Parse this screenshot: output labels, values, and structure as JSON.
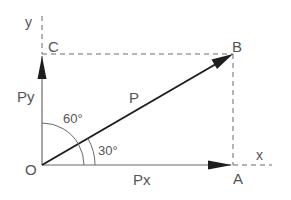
{
  "diagram": {
    "colors": {
      "line": "#6a6a6a",
      "vector": "#1e1e1e",
      "dashed": "#6a6a6a",
      "text": "#555555"
    },
    "points": {
      "origin": {
        "label": "O",
        "x": 42,
        "y": 165
      },
      "A": {
        "label": "A",
        "x": 233,
        "y": 165
      },
      "B": {
        "label": "B",
        "x": 233,
        "y": 54
      },
      "C": {
        "label": "C",
        "x": 42,
        "y": 54
      }
    },
    "axes": {
      "x_label": "x",
      "y_label": "y"
    },
    "vectors": {
      "P": {
        "label": "P",
        "angle_from_x_deg": 30
      },
      "Px": {
        "label": "Px"
      },
      "Py": {
        "label": "Py"
      }
    },
    "angles": {
      "from_y": {
        "label": "60°",
        "deg": 60
      },
      "from_x": {
        "label": "30°",
        "deg": 30
      }
    }
  }
}
